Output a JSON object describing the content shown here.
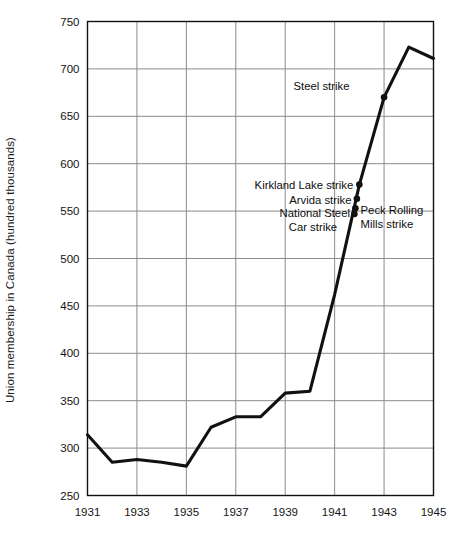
{
  "chart_data": {
    "type": "line",
    "title": "",
    "xlabel": "",
    "ylabel": "Union membership in Canada (hundred thousands)",
    "xlim": [
      1931,
      1945
    ],
    "ylim": [
      250,
      750
    ],
    "grid": true,
    "legend": "none",
    "x_ticks": [
      "1931",
      "1933",
      "1935",
      "1937",
      "1939",
      "1941",
      "1943",
      "1945"
    ],
    "y_ticks": [
      "250",
      "300",
      "350",
      "400",
      "450",
      "500",
      "550",
      "600",
      "650",
      "700",
      "750"
    ],
    "x": [
      1931,
      1932,
      1933,
      1934,
      1935,
      1936,
      1937,
      1938,
      1939,
      1940,
      1941,
      1942,
      1943,
      1944,
      1945
    ],
    "values": [
      314,
      285,
      288,
      285,
      281,
      322,
      333,
      333,
      358,
      360,
      462,
      578,
      670,
      723,
      711
    ],
    "series": [
      {
        "name": "Union membership in Canada",
        "values": [
          314,
          285,
          288,
          285,
          281,
          322,
          333,
          333,
          358,
          360,
          462,
          578,
          670,
          723,
          711
        ]
      }
    ],
    "annotations": [
      {
        "label": "Steel strike",
        "x": 1943.0,
        "y": 670,
        "text_anchor": "end",
        "label_x": 1941.6,
        "label_y": 682
      },
      {
        "label": "Kirkland Lake strike",
        "x": 1942.0,
        "y": 578,
        "text_anchor": "end",
        "label_x": 1941.75,
        "label_y": 578
      },
      {
        "label": "Arvida strike",
        "x": 1941.88,
        "y": 562,
        "text_anchor": "end",
        "label_x": 1941.68,
        "label_y": 562
      },
      {
        "label": "National Steel",
        "x": 1941.8,
        "y": 549,
        "text_anchor": "end",
        "label_x": 1941.62,
        "label_y": 548
      },
      {
        "label": "Car strike",
        "x": null,
        "y": null,
        "text_anchor": "end",
        "label_x": 1941.1,
        "label_y": 533
      },
      {
        "label": "Peck Rolling",
        "x": 1941.85,
        "y": 555,
        "text_anchor": "start",
        "label_x": 1942.05,
        "label_y": 551
      },
      {
        "label": "Mills strike",
        "x": null,
        "y": null,
        "text_anchor": "start",
        "label_x": 1942.05,
        "label_y": 536
      }
    ],
    "markers": [
      {
        "x": 1943.0,
        "y": 670
      },
      {
        "x": 1942.0,
        "y": 578
      },
      {
        "x": 1941.9,
        "y": 563
      },
      {
        "x": 1941.84,
        "y": 553
      },
      {
        "x": 1941.8,
        "y": 547
      }
    ],
    "colors": {
      "line": "#111111",
      "grid": "#8c8c8c",
      "axis": "#111111",
      "text": "#141414",
      "background": "#ffffff"
    }
  }
}
